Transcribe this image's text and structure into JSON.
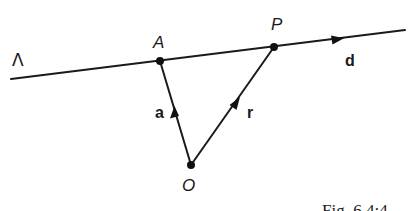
{
  "figure": {
    "caption": "Fig. 6.4:4",
    "line_label": "Λ",
    "points": {
      "A": {
        "label": "A"
      },
      "P": {
        "label": "P"
      },
      "O": {
        "label": "O"
      }
    },
    "vectors": {
      "a": {
        "label": "a",
        "from": "O",
        "to": "A"
      },
      "r": {
        "label": "r",
        "from": "O",
        "to": "P"
      },
      "d": {
        "label": "d",
        "direction_along": "Λ"
      }
    },
    "colors": {
      "ink": "#1a1a1a",
      "background": "#ffffff"
    }
  }
}
